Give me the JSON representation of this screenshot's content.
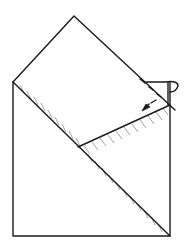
{
  "diagram": {
    "type": "origami-fold-step",
    "colors": {
      "ink": "#1a1a1a",
      "hatch": "#7a7a7a",
      "background": "#ffffff"
    },
    "symbols": [
      "fold-arrow-icon",
      "valley-fold-line"
    ]
  }
}
